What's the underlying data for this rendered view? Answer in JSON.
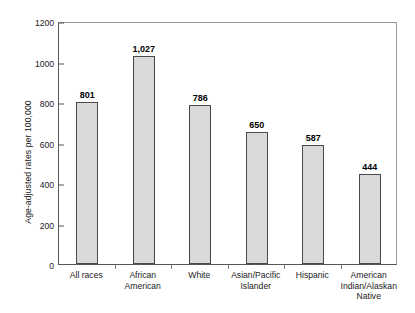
{
  "chart_data": {
    "type": "bar",
    "title": "",
    "subtitle": "",
    "xlabel": "",
    "ylabel": "Age-adjusted rates per 100,000",
    "ylim": [
      0,
      1200
    ],
    "ytick_values": [
      0,
      200,
      400,
      600,
      800,
      1000,
      1200
    ],
    "ytick_labels": [
      "0",
      "200",
      "400",
      "600",
      "800",
      "1000",
      "1200"
    ],
    "grid": false,
    "legend": false,
    "legend_position": "none",
    "categories": [
      "All races",
      "African American",
      "White",
      "Asian/Pacific Islander",
      "Hispanic",
      "American Indian/Alaskan Native"
    ],
    "category_label_lines": [
      [
        "All races"
      ],
      [
        "African",
        "American"
      ],
      [
        "White"
      ],
      [
        "Asian/Pacific",
        "Islander"
      ],
      [
        "Hispanic"
      ],
      [
        "American",
        "Indian/Alaskan",
        "Native"
      ]
    ],
    "values": [
      801,
      1027,
      786,
      650,
      587,
      444
    ],
    "value_labels": [
      "801",
      "1,027",
      "786",
      "650",
      "587",
      "444"
    ],
    "bar_fill_color": "#d9d9d9",
    "bar_edge_color": "#4a4a4a",
    "axis_color": "#555555",
    "background_color": "#ffffff"
  },
  "axis": {
    "y_title": "Age-adjusted rates per 100,000",
    "y_ticks": [
      "1200",
      "1000",
      "800",
      "600",
      "400",
      "200",
      "0"
    ]
  }
}
